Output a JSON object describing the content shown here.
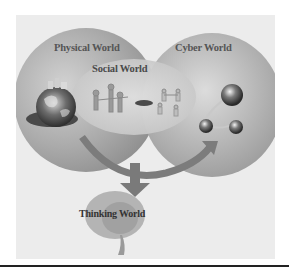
{
  "figure": {
    "labels": {
      "physical": "Physical World",
      "social": "Social World",
      "cyber": "Cyber World",
      "thinking": "Thinking World"
    },
    "icons": {
      "physical": "globe-with-buildings-icon",
      "social": "people-network-icon",
      "cyber": "internet-spheres-icon",
      "thinking": "brain-icon"
    },
    "colors": {
      "background": "#ececec",
      "physical_blob": "#9a9a9a",
      "cyber_blob": "#a4a4a4",
      "social_blob": "#c8c8c8",
      "arrow": "#7a7a7a",
      "brain": "#a8a8a8",
      "text": "#4a4a4a"
    },
    "relations": [
      {
        "from": "Physical World",
        "to": "Cyber World",
        "type": "curved-arrow"
      },
      {
        "from": "Physical World + Social World + Cyber World",
        "to": "Thinking World",
        "type": "down-arrow"
      }
    ]
  }
}
